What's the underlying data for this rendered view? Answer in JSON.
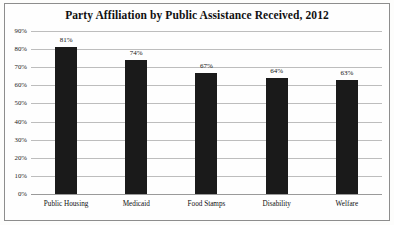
{
  "chart_data": {
    "type": "bar",
    "title": "Party Affiliation by Public Assistance Received, 2012",
    "xlabel": "",
    "ylabel": "",
    "categories": [
      "Public Housing",
      "Medicaid",
      "Food Stamps",
      "Disability",
      "Welfare"
    ],
    "values": [
      81,
      74,
      67,
      64,
      63
    ],
    "value_labels": [
      "81%",
      "74%",
      "67%",
      "64%",
      "63%"
    ],
    "ylim": [
      0,
      90
    ],
    "ytick_values": [
      90,
      80,
      70,
      60,
      50,
      40,
      30,
      20,
      10,
      0
    ],
    "ytick_labels": [
      "90%",
      "80%",
      "70%",
      "60%",
      "50%",
      "40%",
      "30%",
      "20%",
      "10%",
      "0%"
    ],
    "grid": true,
    "legend": false,
    "bar_color": "#1a1a1a",
    "gridline_color": "#bdbdbd",
    "text_color": "#111111"
  }
}
